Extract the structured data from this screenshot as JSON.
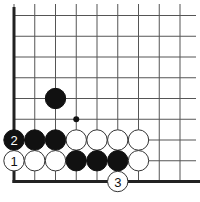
{
  "diagram": {
    "type": "go-board-fragment",
    "visible_edges": [
      "left",
      "bottom"
    ],
    "columns": 9,
    "rows": 9,
    "colors": {
      "line": "#555555",
      "edge": "#222222",
      "black_stone": "#111111",
      "white_stone": "#ffffff",
      "stone_outline": "#333333"
    },
    "hoshi": [
      {
        "col": 3,
        "row": 5
      }
    ],
    "stones": [
      {
        "color": "black",
        "col": 2,
        "row": 4,
        "label": ""
      },
      {
        "color": "black",
        "col": 0,
        "row": 6,
        "label": "2"
      },
      {
        "color": "black",
        "col": 1,
        "row": 6,
        "label": ""
      },
      {
        "color": "black",
        "col": 2,
        "row": 6,
        "label": ""
      },
      {
        "color": "white",
        "col": 3,
        "row": 6,
        "label": ""
      },
      {
        "color": "white",
        "col": 4,
        "row": 6,
        "label": ""
      },
      {
        "color": "white",
        "col": 5,
        "row": 6,
        "label": ""
      },
      {
        "color": "white",
        "col": 6,
        "row": 6,
        "label": ""
      },
      {
        "color": "white",
        "col": 0,
        "row": 7,
        "label": "1"
      },
      {
        "color": "white",
        "col": 1,
        "row": 7,
        "label": ""
      },
      {
        "color": "white",
        "col": 2,
        "row": 7,
        "label": ""
      },
      {
        "color": "black",
        "col": 3,
        "row": 7,
        "label": ""
      },
      {
        "color": "black",
        "col": 4,
        "row": 7,
        "label": ""
      },
      {
        "color": "black",
        "col": 5,
        "row": 7,
        "label": ""
      },
      {
        "color": "white",
        "col": 6,
        "row": 7,
        "label": ""
      },
      {
        "color": "white",
        "col": 5,
        "row": 8,
        "label": "3"
      }
    ]
  }
}
